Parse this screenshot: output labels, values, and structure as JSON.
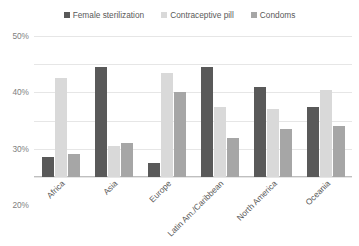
{
  "chart_data": {
    "type": "bar",
    "title": "",
    "xlabel": "",
    "ylabel": "",
    "ylim": [
      0,
      50
    ],
    "y_tick_labels": [
      "0%",
      "10%",
      "20%",
      "30%",
      "40%",
      "50%"
    ],
    "y_tick_values": [
      0,
      10,
      20,
      30,
      40,
      50
    ],
    "grid": true,
    "legend_position": "top-center",
    "categories": [
      "Africa",
      "Asia",
      "Europe",
      "Latin Am./Caribbean",
      "North America",
      "Oceania"
    ],
    "series": [
      {
        "name": "Female sterilization",
        "color": "#595959",
        "values": [
          7,
          39,
          5,
          39,
          32,
          25
        ]
      },
      {
        "name": "Contraceptive pill",
        "color": "#d9d9d9",
        "values": [
          35,
          11,
          37,
          25,
          24,
          31
        ]
      },
      {
        "name": "Condoms",
        "color": "#a6a6a6",
        "values": [
          8,
          12,
          30,
          14,
          17,
          18
        ]
      }
    ]
  },
  "colors": {
    "background": "#ffffff",
    "gridline": "#e6e6e6",
    "axis": "#bfbfbf",
    "tick_text": "#808080",
    "label_text": "#595959"
  }
}
